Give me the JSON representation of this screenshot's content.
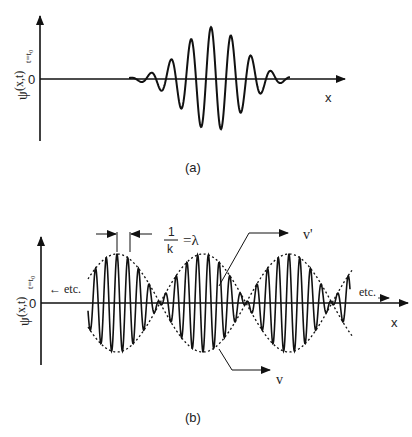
{
  "panel_a": {
    "caption": "(a)",
    "ylabel": "ψ(x,t)t=t0",
    "ylabel_main": "ψ",
    "ylabel_args": "(x,t)",
    "ylabel_sub": "t=t₀",
    "zero_label": "0",
    "xlabel": "x"
  },
  "panel_b": {
    "caption": "(b)",
    "ylabel_main": "ψ",
    "ylabel_args": "(x,t)",
    "ylabel_sub": "t=t₀",
    "zero_label": "0",
    "xlabel": "x",
    "etc_left": "← etc.",
    "etc_right": "etc.",
    "wavelength_num": "1",
    "wavelength_den": "k",
    "wavelength_eq": "=λ",
    "phase_velocity_label": "v'",
    "group_velocity_label": "v"
  }
}
